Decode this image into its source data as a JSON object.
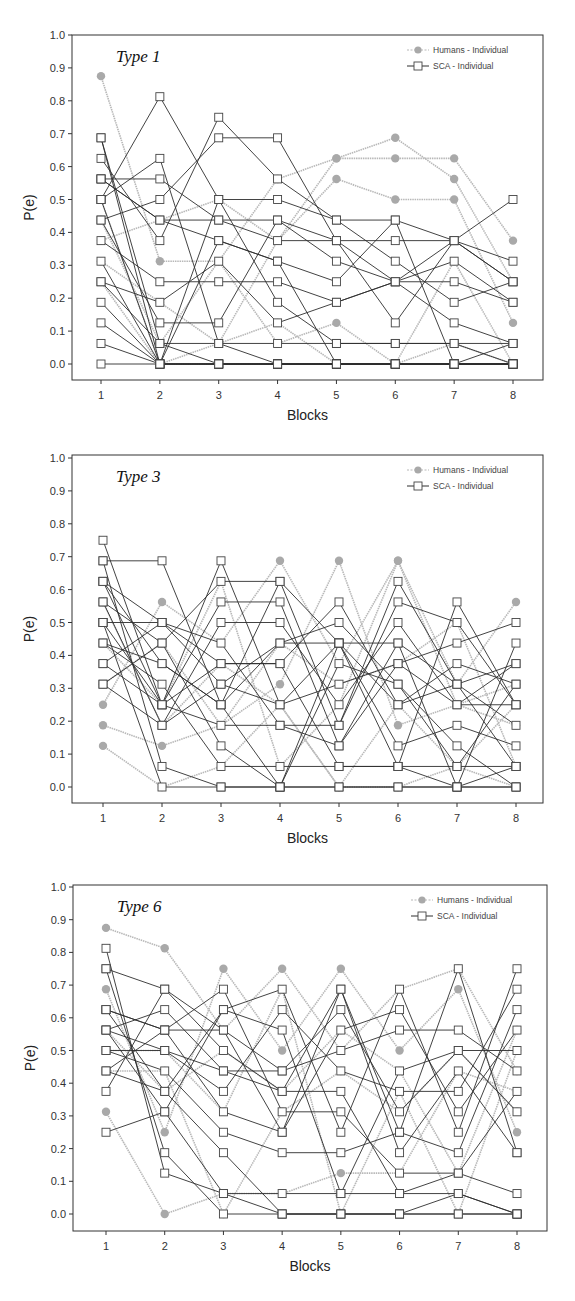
{
  "legend": {
    "humans_label": "Humans - Individual",
    "sca_label": "SCA - Individual"
  },
  "colors": {
    "humans_line": "#b8b8b8",
    "humans_marker": "#a9a9a9",
    "sca_line": "#2e2e2e",
    "sca_marker_fill": "#ffffff",
    "sca_marker_stroke": "#444444",
    "axis": "#333333"
  },
  "chart_data": [
    {
      "type": "line",
      "title": "Type 1",
      "xlabel": "Blocks",
      "ylabel": "P(e)",
      "x": [
        1,
        2,
        3,
        4,
        5,
        6,
        7,
        8
      ],
      "xticks": [
        "1",
        "2",
        "3",
        "4",
        "5",
        "6",
        "7",
        "8"
      ],
      "yticks": [
        "0.0",
        "0.1",
        "0.2",
        "0.3",
        "0.4",
        "0.5",
        "0.6",
        "0.7",
        "0.8",
        "0.9",
        "1.0"
      ],
      "ylim": [
        0,
        1
      ],
      "grid": false,
      "legend_position": "upper right",
      "layout": {
        "top": 35,
        "bottom": 380,
        "left": 72,
        "right": 543,
        "y1": 35,
        "y0": 364,
        "x1": 101,
        "x8": 513
      },
      "series": [
        {
          "name": "Humans - Individual",
          "values": [
            0.875,
            0.3125,
            0.3125,
            0.0625,
            0.125,
            0.0,
            0.0,
            0.0
          ]
        },
        {
          "name": "Humans - Individual",
          "values": [
            0.5,
            0.0,
            0.0625,
            0.125,
            0.0,
            0.0,
            0.0625,
            0.0
          ]
        },
        {
          "name": "Humans - Individual",
          "values": [
            0.4375,
            0.0625,
            0.3125,
            0.5625,
            0.625,
            0.625,
            0.625,
            0.375
          ]
        },
        {
          "name": "Humans - Individual",
          "values": [
            0.375,
            0.4375,
            0.5,
            0.375,
            0.5625,
            0.5,
            0.5,
            0.125
          ]
        },
        {
          "name": "Humans - Individual",
          "values": [
            0.3125,
            0.1875,
            0.0625,
            0.375,
            0.625,
            0.6875,
            0.5625,
            0.25
          ]
        },
        {
          "name": "Humans - Individual",
          "values": [
            0.25,
            0.0,
            0.0,
            0.0,
            0.0,
            0.0,
            0.3125,
            0.0
          ]
        },
        {
          "name": "SCA - Individual",
          "values": [
            0.6875,
            0.0,
            0.0,
            0.0,
            0.0,
            0.0,
            0.0,
            0.0
          ]
        },
        {
          "name": "SCA - Individual",
          "values": [
            0.6875,
            0.0625,
            0.0625,
            0.0625,
            0.0625,
            0.0625,
            0.0625,
            0.0625
          ]
        },
        {
          "name": "SCA - Individual",
          "values": [
            0.625,
            0.375,
            0.75,
            0.5625,
            0.4375,
            0.4375,
            0.375,
            0.3125
          ]
        },
        {
          "name": "SCA - Individual",
          "values": [
            0.5625,
            0.5625,
            0.4375,
            0.4375,
            0.375,
            0.375,
            0.375,
            0.25
          ]
        },
        {
          "name": "SCA - Individual",
          "values": [
            0.5625,
            0.4375,
            0.375,
            0.3125,
            0.25,
            0.4375,
            0.0,
            0.0625
          ]
        },
        {
          "name": "SCA - Individual",
          "values": [
            0.5,
            0.8125,
            0.5,
            0.5,
            0.4375,
            0.3125,
            0.1875,
            0.25
          ]
        },
        {
          "name": "SCA - Individual",
          "values": [
            0.5,
            0.625,
            0.0625,
            0.0,
            0.0,
            0.0,
            0.0,
            0.0
          ]
        },
        {
          "name": "SCA - Individual",
          "values": [
            0.4375,
            0.5,
            0.6875,
            0.6875,
            0.375,
            0.125,
            0.375,
            0.5
          ]
        },
        {
          "name": "SCA - Individual",
          "values": [
            0.4375,
            0.125,
            0.125,
            0.4375,
            0.3125,
            0.25,
            0.25,
            0.1875
          ]
        },
        {
          "name": "SCA - Individual",
          "values": [
            0.375,
            0.25,
            0.25,
            0.25,
            0.1875,
            0.25,
            0.3125,
            0.1875
          ]
        },
        {
          "name": "SCA - Individual",
          "values": [
            0.3125,
            0.0,
            0.375,
            0.3125,
            0.0,
            0.0,
            0.0,
            0.0
          ]
        },
        {
          "name": "SCA - Individual",
          "values": [
            0.25,
            0.0625,
            0.0,
            0.0,
            0.0,
            0.0,
            0.0,
            0.0
          ]
        },
        {
          "name": "SCA - Individual",
          "values": [
            0.25,
            0.1875,
            0.3125,
            0.125,
            0.1875,
            0.25,
            0.125,
            0.0625
          ]
        },
        {
          "name": "SCA - Individual",
          "values": [
            0.1875,
            0.0,
            0.0,
            0.0,
            0.0,
            0.0,
            0.0,
            0.0
          ]
        },
        {
          "name": "SCA - Individual",
          "values": [
            0.125,
            0.0,
            0.0,
            0.0,
            0.0,
            0.0,
            0.0,
            0.0
          ]
        },
        {
          "name": "SCA - Individual",
          "values": [
            0.0625,
            0.0,
            0.0,
            0.0,
            0.0,
            0.0,
            0.0,
            0.0
          ]
        },
        {
          "name": "SCA - Individual",
          "values": [
            0.0,
            0.0,
            0.0,
            0.0,
            0.0,
            0.0,
            0.0,
            0.0
          ]
        },
        {
          "name": "SCA - Individual",
          "values": [
            0.5625,
            0.4375,
            0.4375,
            0.375,
            0.375,
            0.25,
            0.375,
            0.25
          ]
        },
        {
          "name": "SCA - Individual",
          "values": [
            0.5,
            0.0,
            0.5,
            0.1875,
            0.0625,
            0.0625,
            0.0625,
            0.0
          ]
        }
      ]
    },
    {
      "type": "line",
      "title": "Type 3",
      "xlabel": "Blocks",
      "ylabel": "P(e)",
      "x": [
        1,
        2,
        3,
        4,
        5,
        6,
        7,
        8
      ],
      "xticks": [
        "1",
        "2",
        "3",
        "4",
        "5",
        "6",
        "7",
        "8"
      ],
      "yticks": [
        "0.0",
        "0.1",
        "0.2",
        "0.3",
        "0.4",
        "0.5",
        "0.6",
        "0.7",
        "0.8",
        "0.9",
        "1.0"
      ],
      "ylim": [
        0,
        1
      ],
      "grid": false,
      "legend_position": "upper right",
      "layout": {
        "top": 455,
        "bottom": 803,
        "left": 72,
        "right": 543,
        "y1": 458,
        "y0": 787,
        "x1": 103,
        "x8": 516
      },
      "series": [
        {
          "name": "Humans - Individual",
          "values": [
            0.25,
            0.5625,
            0.4375,
            0.6875,
            0.375,
            0.6875,
            0.3125,
            0.5625
          ]
        },
        {
          "name": "Humans - Individual",
          "values": [
            0.1875,
            0.125,
            0.1875,
            0.3125,
            0.6875,
            0.1875,
            0.25,
            0.1875
          ]
        },
        {
          "name": "Humans - Individual",
          "values": [
            0.125,
            0.0,
            0.0625,
            0.25,
            0.0,
            0.0,
            0.0625,
            0.0
          ]
        },
        {
          "name": "Humans - Individual",
          "values": [
            0.4375,
            0.25,
            0.625,
            0.0625,
            0.25,
            0.6875,
            0.25,
            0.3125
          ]
        },
        {
          "name": "Humans - Individual",
          "values": [
            0.3125,
            0.4375,
            0.1875,
            0.4375,
            0.3125,
            0.375,
            0.5,
            0.0625
          ]
        },
        {
          "name": "Humans - Individual",
          "values": [
            0.5625,
            0.1875,
            0.375,
            0.25,
            0.0,
            0.25,
            0.0625,
            0.25
          ]
        },
        {
          "name": "SCA - Individual",
          "values": [
            0.75,
            0.25,
            0.6875,
            0.25,
            0.4375,
            0.0625,
            0.5625,
            0.25
          ]
        },
        {
          "name": "SCA - Individual",
          "values": [
            0.6875,
            0.6875,
            0.25,
            0.625,
            0.1875,
            0.625,
            0.3125,
            0.0625
          ]
        },
        {
          "name": "SCA - Individual",
          "values": [
            0.6875,
            0.0625,
            0.0,
            0.0,
            0.0,
            0.0,
            0.0,
            0.0
          ]
        },
        {
          "name": "SCA - Individual",
          "values": [
            0.625,
            0.5,
            0.375,
            0.375,
            0.5625,
            0.25,
            0.375,
            0.3125
          ]
        },
        {
          "name": "SCA - Individual",
          "values": [
            0.625,
            0.25,
            0.5625,
            0.5625,
            0.125,
            0.4375,
            0.0,
            0.4375
          ]
        },
        {
          "name": "SCA - Individual",
          "values": [
            0.5625,
            0.4375,
            0.125,
            0.0,
            0.375,
            0.3125,
            0.125,
            0.0
          ]
        },
        {
          "name": "SCA - Individual",
          "values": [
            0.5625,
            0.1875,
            0.5,
            0.5,
            0.25,
            0.5,
            0.25,
            0.375
          ]
        },
        {
          "name": "SCA - Individual",
          "values": [
            0.5,
            0.5,
            0.4375,
            0.1875,
            0.1875,
            0.5625,
            0.5,
            0.25
          ]
        },
        {
          "name": "SCA - Individual",
          "values": [
            0.5,
            0.0,
            0.0,
            0.0,
            0.0,
            0.0,
            0.0,
            0.0
          ]
        },
        {
          "name": "SCA - Individual",
          "values": [
            0.4375,
            0.375,
            0.25,
            0.4375,
            0.4375,
            0.125,
            0.1875,
            0.125
          ]
        },
        {
          "name": "SCA - Individual",
          "values": [
            0.4375,
            0.3125,
            0.0625,
            0.0625,
            0.0625,
            0.0625,
            0.0625,
            0.0625
          ]
        },
        {
          "name": "SCA - Individual",
          "values": [
            0.375,
            0.5,
            0.3125,
            0.25,
            0.3125,
            0.375,
            0.4375,
            0.5
          ]
        },
        {
          "name": "SCA - Individual",
          "values": [
            0.375,
            0.25,
            0.1875,
            0.1875,
            0.125,
            0.375,
            0.25,
            0.25
          ]
        },
        {
          "name": "SCA - Individual",
          "values": [
            0.3125,
            0.4375,
            0.625,
            0.625,
            0.4375,
            0.25,
            0.3125,
            0.1875
          ]
        },
        {
          "name": "SCA - Individual",
          "values": [
            0.3125,
            0.1875,
            0.3125,
            0.4375,
            0.5,
            0.3125,
            0.0625,
            0.3125
          ]
        },
        {
          "name": "SCA - Individual",
          "values": [
            0.625,
            0.375,
            0.25,
            0.0,
            0.4375,
            0.4375,
            0.3125,
            0.375
          ]
        },
        {
          "name": "SCA - Individual",
          "values": [
            0.5,
            0.25,
            0.375,
            0.375,
            0.0625,
            0.0625,
            0.0,
            0.0625
          ]
        }
      ]
    },
    {
      "type": "line",
      "title": "Type 6",
      "xlabel": "Blocks",
      "ylabel": "P(e)",
      "x": [
        1,
        2,
        3,
        4,
        5,
        6,
        7,
        8
      ],
      "xticks": [
        "1",
        "2",
        "3",
        "4",
        "5",
        "6",
        "7",
        "8"
      ],
      "yticks": [
        "0.0",
        "0.1",
        "0.2",
        "0.3",
        "0.4",
        "0.5",
        "0.6",
        "0.7",
        "0.8",
        "0.9",
        "1.0"
      ],
      "ylim": [
        0,
        1
      ],
      "grid": false,
      "legend_position": "upper right",
      "layout": {
        "top": 885,
        "bottom": 1231,
        "left": 73,
        "right": 547,
        "y1": 887,
        "y0": 1214,
        "x1": 106,
        "x8": 517
      },
      "series": [
        {
          "name": "Humans - Individual",
          "values": [
            0.875,
            0.8125,
            0.5625,
            0.75,
            0.5,
            0.6875,
            0.75,
            0.4375
          ]
        },
        {
          "name": "Humans - Individual",
          "values": [
            0.6875,
            0.25,
            0.75,
            0.5,
            0.75,
            0.5,
            0.6875,
            0.25
          ]
        },
        {
          "name": "Humans - Individual",
          "values": [
            0.3125,
            0.0,
            0.0625,
            0.0625,
            0.125,
            0.125,
            0.4375,
            0.375
          ]
        },
        {
          "name": "Humans - Individual",
          "values": [
            0.5,
            0.5,
            0.3125,
            0.6875,
            0.0,
            0.375,
            0.0,
            0.5
          ]
        },
        {
          "name": "Humans - Individual",
          "values": [
            0.4375,
            0.4375,
            0.0,
            0.3125,
            0.4375,
            0.3125,
            0.5,
            0.3125
          ]
        },
        {
          "name": "Humans - Individual",
          "values": [
            0.5625,
            0.375,
            0.5,
            0.375,
            0.5625,
            0.4375,
            0.125,
            0.5625
          ]
        },
        {
          "name": "SCA - Individual",
          "values": [
            0.8125,
            0.125,
            0.0625,
            0.0,
            0.0,
            0.0,
            0.0,
            0.0
          ]
        },
        {
          "name": "SCA - Individual",
          "values": [
            0.75,
            0.6875,
            0.5625,
            0.25,
            0.6875,
            0.25,
            0.75,
            0.1875
          ]
        },
        {
          "name": "SCA - Individual",
          "values": [
            0.75,
            0.1875,
            0.0,
            0.0,
            0.0,
            0.0,
            0.0,
            0.0
          ]
        },
        {
          "name": "SCA - Individual",
          "values": [
            0.625,
            0.5625,
            0.6875,
            0.3125,
            0.3125,
            0.125,
            0.125,
            0.0625
          ]
        },
        {
          "name": "SCA - Individual",
          "values": [
            0.625,
            0.375,
            0.625,
            0.6875,
            0.25,
            0.6875,
            0.25,
            0.75
          ]
        },
        {
          "name": "SCA - Individual",
          "values": [
            0.5625,
            0.625,
            0.4375,
            0.4375,
            0.5,
            0.5625,
            0.5625,
            0.4375
          ]
        },
        {
          "name": "SCA - Individual",
          "values": [
            0.5625,
            0.3125,
            0.625,
            0.5625,
            0.0625,
            0.4375,
            0.5,
            0.5
          ]
        },
        {
          "name": "SCA - Individual",
          "values": [
            0.5,
            0.5,
            0.375,
            0.625,
            0.4375,
            0.375,
            0.375,
            0.6875
          ]
        },
        {
          "name": "SCA - Individual",
          "values": [
            0.5,
            0.4375,
            0.25,
            0.1875,
            0.1875,
            0.25,
            0.1875,
            0.625
          ]
        },
        {
          "name": "SCA - Individual",
          "values": [
            0.4375,
            0.5625,
            0.3125,
            0.25,
            0.5625,
            0.625,
            0.3125,
            0.5625
          ]
        },
        {
          "name": "SCA - Individual",
          "values": [
            0.4375,
            0.375,
            0.1875,
            0.0,
            0.0,
            0.0,
            0.0625,
            0.0
          ]
        },
        {
          "name": "SCA - Individual",
          "values": [
            0.375,
            0.6875,
            0.5,
            0.375,
            0.375,
            0.0625,
            0.125,
            0.375
          ]
        },
        {
          "name": "SCA - Individual",
          "values": [
            0.25,
            0.3125,
            0.0625,
            0.0625,
            0.0625,
            0.0625,
            0.0625,
            0.0
          ]
        },
        {
          "name": "SCA - Individual",
          "values": [
            0.625,
            0.5625,
            0.5625,
            0.4375,
            0.625,
            0.3125,
            0.5,
            0.3125
          ]
        },
        {
          "name": "SCA - Individual",
          "values": [
            0.5625,
            0.5,
            0.4375,
            0.375,
            0.6875,
            0.1875,
            0.4375,
            0.1875
          ]
        }
      ]
    }
  ]
}
